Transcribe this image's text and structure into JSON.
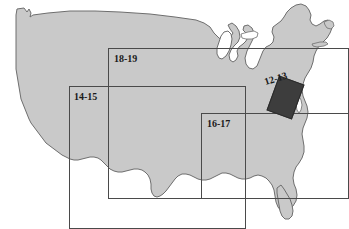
{
  "figure": {
    "type": "reference-map",
    "colors": {
      "land_fill": "#c9c9c9",
      "land_stroke": "#6e6e6e",
      "box_stroke": "#4a4a4a",
      "highlight_fill": "#3d3d3d",
      "background": "#ffffff",
      "label_text": "#1a1a1a"
    },
    "insets": [
      {
        "id": "inset-18-19",
        "label": "18-19",
        "region": "Northern tier / Upper Midwest and Northeast",
        "box": {
          "left": 108,
          "top": 48,
          "width": 241,
          "height": 151
        },
        "label_pos": {
          "left": 114,
          "top": 54
        },
        "rotated": false
      },
      {
        "id": "inset-14-15",
        "label": "14-15",
        "region": "Southwest and Central Plains",
        "box": {
          "left": 69,
          "top": 86,
          "width": 177,
          "height": 143
        },
        "label_pos": {
          "left": 74,
          "top": 92
        },
        "rotated": false
      },
      {
        "id": "inset-16-17",
        "label": "16-17",
        "region": "Southeast / Gulf Coast",
        "box": {
          "left": 201,
          "top": 113,
          "width": 148,
          "height": 86
        },
        "label_pos": {
          "left": 207,
          "top": 119
        },
        "rotated": false
      },
      {
        "id": "inset-12-13",
        "label": "12-13",
        "region": "Chesapeake Bay / Mid-Atlantic",
        "box": null,
        "label_pos": {
          "left": 266,
          "top": 77
        },
        "rotated": true
      }
    ],
    "highlight": {
      "id": "chesapeake-highlight",
      "label_ref": "12-13",
      "left": 272,
      "top": 79,
      "width": 27,
      "height": 37,
      "rotation_deg": 20
    }
  }
}
